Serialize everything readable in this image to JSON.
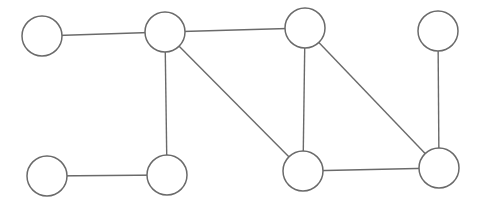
{
  "diagram": {
    "type": "undirected-graph",
    "colors": {
      "stroke": "#6a6a6a",
      "fill": "#ffffff",
      "background": "#ffffff"
    },
    "nodes": [
      {
        "id": "A",
        "cx": 42,
        "cy": 36,
        "r": 20
      },
      {
        "id": "B",
        "cx": 165,
        "cy": 32,
        "r": 20
      },
      {
        "id": "C",
        "cx": 305,
        "cy": 28,
        "r": 20
      },
      {
        "id": "D",
        "cx": 438,
        "cy": 31,
        "r": 20
      },
      {
        "id": "E",
        "cx": 47,
        "cy": 176,
        "r": 20
      },
      {
        "id": "F",
        "cx": 167,
        "cy": 175,
        "r": 20
      },
      {
        "id": "G",
        "cx": 303,
        "cy": 171,
        "r": 20
      },
      {
        "id": "H",
        "cx": 439,
        "cy": 168,
        "r": 20
      }
    ],
    "edges": [
      {
        "from": "A",
        "to": "B"
      },
      {
        "from": "B",
        "to": "C"
      },
      {
        "from": "B",
        "to": "F"
      },
      {
        "from": "B",
        "to": "G"
      },
      {
        "from": "C",
        "to": "G"
      },
      {
        "from": "C",
        "to": "H"
      },
      {
        "from": "D",
        "to": "H"
      },
      {
        "from": "E",
        "to": "F"
      },
      {
        "from": "G",
        "to": "H"
      }
    ]
  }
}
